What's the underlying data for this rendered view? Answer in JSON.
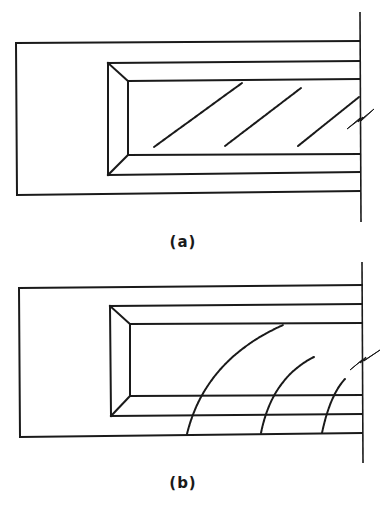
{
  "figure": {
    "panels": [
      {
        "id": "a",
        "label": "(a)",
        "description": "Cantilever beam with inclined (diagonal) cracks near wall support",
        "crack_type": "diagonal"
      },
      {
        "id": "b",
        "label": "(b)",
        "description": "Cantilever beam with curved flexure-shear cracks near wall support",
        "crack_type": "curved"
      }
    ],
    "colors": {
      "line": "#1a1a1a",
      "background": "#ffffff"
    }
  }
}
